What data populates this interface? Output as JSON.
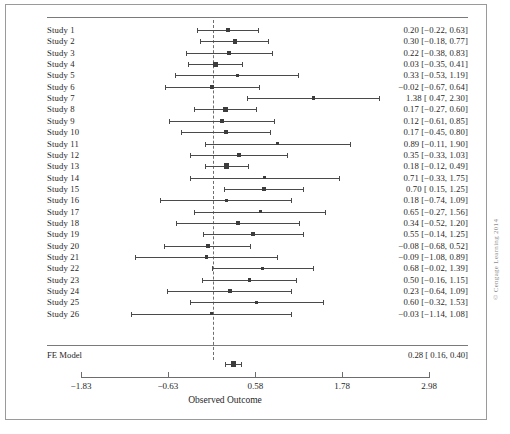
{
  "figure": {
    "axis_title": "Observed Outcome",
    "copyright": "© Cengage Learning 2014",
    "summary_label": "FE Model",
    "summary_value": "0.28 [  0.16, 0.40]"
  },
  "chart_data": {
    "type": "forest",
    "title": "",
    "xlabel": "Observed Outcome",
    "ylabel": "",
    "xlim": [
      -1.83,
      2.98
    ],
    "xticks": [
      -1.83,
      -0.63,
      0.58,
      1.78,
      2.98
    ],
    "xticklabels": [
      "−1.83",
      "−0.63",
      "0.58",
      "1.78",
      "2.98"
    ],
    "reference_line": 0,
    "grid": false,
    "legend": "none",
    "model": "FE Model",
    "summary": {
      "label": "FE Model",
      "estimate": 0.28,
      "ci_low": 0.16,
      "ci_high": 0.4,
      "text": "0.28 [  0.16, 0.40]"
    },
    "studies": [
      {
        "label": "Study 1",
        "estimate": 0.2,
        "ci_low": -0.22,
        "ci_high": 0.63,
        "text": "0.20 [−0.22, 0.63]"
      },
      {
        "label": "Study 2",
        "estimate": 0.3,
        "ci_low": -0.18,
        "ci_high": 0.77,
        "text": "0.30 [−0.18, 0.77]"
      },
      {
        "label": "Study 3",
        "estimate": 0.22,
        "ci_low": -0.38,
        "ci_high": 0.83,
        "text": "0.22 [−0.38, 0.83]"
      },
      {
        "label": "Study 4",
        "estimate": 0.03,
        "ci_low": -0.35,
        "ci_high": 0.41,
        "text": "0.03 [−0.35, 0.41]"
      },
      {
        "label": "Study 5",
        "estimate": 0.33,
        "ci_low": -0.53,
        "ci_high": 1.19,
        "text": "0.33 [−0.53, 1.19]"
      },
      {
        "label": "Study 6",
        "estimate": -0.02,
        "ci_low": -0.67,
        "ci_high": 0.64,
        "text": "−0.02 [−0.67, 0.64]"
      },
      {
        "label": "Study 7",
        "estimate": 1.38,
        "ci_low": 0.47,
        "ci_high": 2.3,
        "text": "1.38 [  0.47, 2.30]"
      },
      {
        "label": "Study 8",
        "estimate": 0.17,
        "ci_low": -0.27,
        "ci_high": 0.6,
        "text": "0.17 [−0.27, 0.60]"
      },
      {
        "label": "Study 9",
        "estimate": 0.12,
        "ci_low": -0.61,
        "ci_high": 0.85,
        "text": "0.12 [−0.61, 0.85]"
      },
      {
        "label": "Study 10",
        "estimate": 0.17,
        "ci_low": -0.45,
        "ci_high": 0.8,
        "text": "0.17 [−0.45, 0.80]"
      },
      {
        "label": "Study 11",
        "estimate": 0.89,
        "ci_low": -0.11,
        "ci_high": 1.9,
        "text": "0.89 [−0.11, 1.90]"
      },
      {
        "label": "Study 12",
        "estimate": 0.35,
        "ci_low": -0.33,
        "ci_high": 1.03,
        "text": "0.35 [−0.33, 1.03]"
      },
      {
        "label": "Study 13",
        "estimate": 0.18,
        "ci_low": -0.12,
        "ci_high": 0.49,
        "text": "0.18 [−0.12, 0.49]"
      },
      {
        "label": "Study 14",
        "estimate": 0.71,
        "ci_low": -0.33,
        "ci_high": 1.75,
        "text": "0.71 [−0.33, 1.75]"
      },
      {
        "label": "Study 15",
        "estimate": 0.7,
        "ci_low": 0.15,
        "ci_high": 1.25,
        "text": "0.70 [  0.15, 1.25]"
      },
      {
        "label": "Study 16",
        "estimate": 0.18,
        "ci_low": -0.74,
        "ci_high": 1.09,
        "text": "0.18 [−0.74, 1.09]"
      },
      {
        "label": "Study 17",
        "estimate": 0.65,
        "ci_low": -0.27,
        "ci_high": 1.56,
        "text": "0.65 [−0.27, 1.56]"
      },
      {
        "label": "Study 18",
        "estimate": 0.34,
        "ci_low": -0.52,
        "ci_high": 1.2,
        "text": "0.34 [−0.52, 1.20]"
      },
      {
        "label": "Study 19",
        "estimate": 0.55,
        "ci_low": -0.14,
        "ci_high": 1.25,
        "text": "0.55 [−0.14, 1.25]"
      },
      {
        "label": "Study 20",
        "estimate": -0.08,
        "ci_low": -0.68,
        "ci_high": 0.52,
        "text": "−0.08 [−0.68, 0.52]"
      },
      {
        "label": "Study 21",
        "estimate": -0.09,
        "ci_low": -1.08,
        "ci_high": 0.89,
        "text": "−0.09 [−1.08, 0.89]"
      },
      {
        "label": "Study 22",
        "estimate": 0.68,
        "ci_low": -0.02,
        "ci_high": 1.39,
        "text": "0.68 [−0.02, 1.39]"
      },
      {
        "label": "Study 23",
        "estimate": 0.5,
        "ci_low": -0.16,
        "ci_high": 1.15,
        "text": "0.50 [−0.16, 1.15]"
      },
      {
        "label": "Study 24",
        "estimate": 0.23,
        "ci_low": -0.64,
        "ci_high": 1.09,
        "text": "0.23 [−0.64, 1.09]"
      },
      {
        "label": "Study 25",
        "estimate": 0.6,
        "ci_low": -0.32,
        "ci_high": 1.53,
        "text": "0.60 [−0.32, 1.53]"
      },
      {
        "label": "Study 26",
        "estimate": -0.03,
        "ci_low": -1.14,
        "ci_high": 1.08,
        "text": "−0.03 [−1.14, 1.08]"
      }
    ]
  }
}
